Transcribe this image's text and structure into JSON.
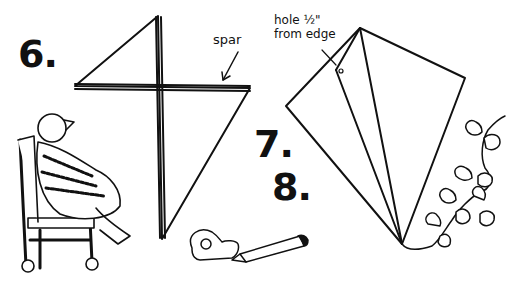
{
  "illustration": {
    "steps": [
      {
        "number": "6.",
        "description": "Kite with crossed spars"
      },
      {
        "number": "7.",
        "description": "Folding sail edge"
      },
      {
        "number": "8.",
        "description": "Tape and pencil"
      }
    ],
    "labels": {
      "spar": "spar",
      "hole_line1": "hole ½\"",
      "hole_line2": "from edge"
    },
    "colors": {
      "ink": "#111111",
      "paper": "#ffffff"
    }
  }
}
